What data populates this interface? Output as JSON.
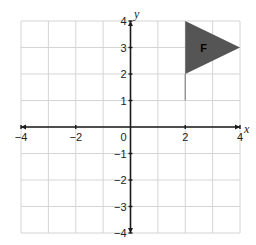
{
  "chart_data": {
    "type": "coordinate-plane",
    "title": "",
    "xlabel": "x",
    "ylabel": "y",
    "xlim": [
      -4,
      4
    ],
    "ylim": [
      -4,
      4
    ],
    "grid": true,
    "grid_step": 1,
    "x_tick_labels": [
      {
        "value": -4,
        "label": "−4"
      },
      {
        "value": -2,
        "label": "−2"
      },
      {
        "value": 0,
        "label": "0"
      },
      {
        "value": 2,
        "label": "2"
      },
      {
        "value": 4,
        "label": "4"
      }
    ],
    "y_tick_labels": [
      {
        "value": 4,
        "label": "4"
      },
      {
        "value": 3,
        "label": "3"
      },
      {
        "value": 2,
        "label": "2"
      },
      {
        "value": 1,
        "label": "1"
      },
      {
        "value": -1,
        "label": "−1"
      },
      {
        "value": -2,
        "label": "−2"
      },
      {
        "value": -3,
        "label": "−3"
      },
      {
        "value": -4,
        "label": "−4"
      }
    ],
    "shapes": [
      {
        "name": "F",
        "type": "flag",
        "triangle_vertices": [
          [
            2,
            4
          ],
          [
            4,
            3
          ],
          [
            2,
            2
          ]
        ],
        "pole": [
          [
            2,
            2
          ],
          [
            2,
            1
          ]
        ],
        "fill_color": "#555555",
        "pole_color": "#888888"
      }
    ]
  },
  "colors": {
    "grid": "#d4d4d4",
    "axis": "#1a1a1a",
    "flag_fill": "#555555",
    "pole": "#888888"
  }
}
